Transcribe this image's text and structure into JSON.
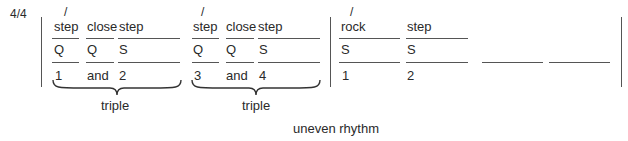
{
  "time_signature": "4/4",
  "measures": [
    {
      "accent": "/",
      "columns": [
        {
          "step": "step",
          "count_type": "Q",
          "count": "1"
        },
        {
          "step": "close",
          "count_type": "Q",
          "count": "and"
        },
        {
          "step": "step",
          "count_type": "S",
          "count": "2"
        }
      ],
      "group_label": "triple"
    },
    {
      "accent": "/",
      "columns": [
        {
          "step": "step",
          "count_type": "Q",
          "count": "3"
        },
        {
          "step": "close",
          "count_type": "Q",
          "count": "and"
        },
        {
          "step": "step",
          "count_type": "S",
          "count": "4"
        }
      ],
      "group_label": "triple"
    },
    {
      "accent": "/",
      "columns": [
        {
          "step": "rock",
          "count_type": "S",
          "count": "1"
        },
        {
          "step": "step",
          "count_type": "S",
          "count": "2"
        },
        {
          "step": "",
          "count_type": "",
          "count": ""
        },
        {
          "step": "",
          "count_type": "",
          "count": ""
        }
      ]
    }
  ],
  "caption": "uneven rhythm"
}
